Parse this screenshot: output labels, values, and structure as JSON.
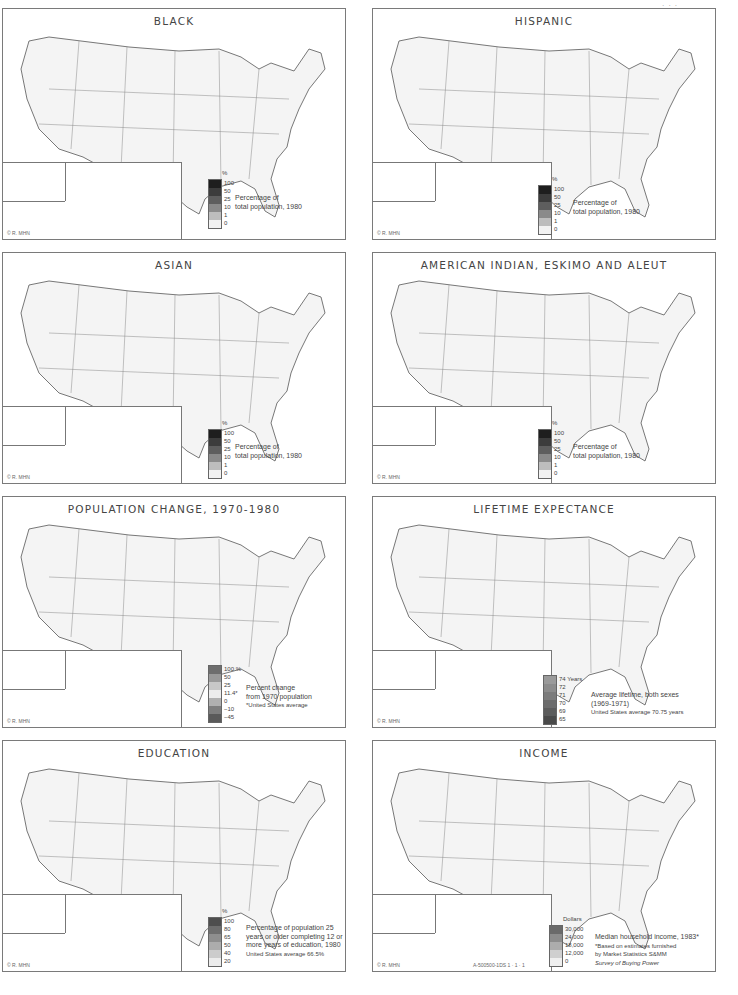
{
  "page": {
    "page_mark": "·  ·  ·",
    "plate_code": "A-500500-1DS  1 · 1 · 1"
  },
  "panels": [
    {
      "id": "black",
      "title": "BLACK",
      "legend": {
        "unit": "%",
        "ticks": [
          "100",
          "50",
          "25",
          "10",
          "1",
          "0"
        ],
        "colors": [
          "#1e1e1e",
          "#3c3c3c",
          "#5e5e5e",
          "#8a8a8a",
          "#bdbdbd",
          "#f2f2f2"
        ],
        "caption": [
          "Percentage of",
          "total population, 1980"
        ]
      },
      "credit": "© R. MHN"
    },
    {
      "id": "hispanic",
      "title": "HISPANIC",
      "legend": {
        "unit": "%",
        "ticks": [
          "100",
          "50",
          "25",
          "10",
          "1",
          "0"
        ],
        "colors": [
          "#1e1e1e",
          "#3c3c3c",
          "#5e5e5e",
          "#8a8a8a",
          "#bdbdbd",
          "#f2f2f2"
        ],
        "caption": [
          "Percentage of",
          "total population, 1980"
        ]
      },
      "credit": "© R. MHN"
    },
    {
      "id": "asian",
      "title": "ASIAN",
      "legend": {
        "unit": "%",
        "ticks": [
          "100",
          "50",
          "25",
          "10",
          "1",
          "0"
        ],
        "colors": [
          "#1e1e1e",
          "#3c3c3c",
          "#5e5e5e",
          "#8a8a8a",
          "#bdbdbd",
          "#f2f2f2"
        ],
        "caption": [
          "Percentage of",
          "total population, 1980"
        ]
      },
      "credit": "© R. MHN"
    },
    {
      "id": "american-indian",
      "title": "AMERICAN INDIAN, ESKIMO AND ALEUT",
      "legend": {
        "unit": "%",
        "ticks": [
          "100",
          "50",
          "25",
          "10",
          "1",
          "0"
        ],
        "colors": [
          "#1e1e1e",
          "#3c3c3c",
          "#5e5e5e",
          "#8a8a8a",
          "#bdbdbd",
          "#f2f2f2"
        ],
        "caption": [
          "Percentage of",
          "total population, 1980"
        ]
      },
      "credit": "© R. MHN"
    },
    {
      "id": "population-change",
      "title": "POPULATION CHANGE, 1970-1980",
      "legend": {
        "unit": "",
        "ticks": [
          "100 %",
          "50",
          "25",
          "11.4*",
          "0",
          "−10",
          "−45"
        ],
        "colors": [
          "#6e6e6e",
          "#9a9a9a",
          "#c8c8c8",
          "#ececec",
          "#b0b0b0",
          "#7e7e7e",
          "#5a5a5a"
        ],
        "caption": [
          "Percent change",
          "from 1970 population",
          "*United States average"
        ]
      },
      "credit": "© R. MHN"
    },
    {
      "id": "lifetime-expectancy",
      "title": "LIFETIME EXPECTANCE",
      "legend": {
        "unit": "",
        "ticks": [
          "74 Years",
          "72",
          "71",
          "70",
          "69",
          "65"
        ],
        "colors": [
          "#9a9a9a",
          "#8c8c8c",
          "#7c7c7c",
          "#6c6c6c",
          "#5c5c5c",
          "#4a4a4a"
        ],
        "caption": [
          "Average lifetime, both sexes",
          "(1969-1971)",
          "United States average 70.75 years"
        ]
      },
      "credit": "© R. MHN"
    },
    {
      "id": "education",
      "title": "EDUCATION",
      "legend": {
        "unit": "%",
        "ticks": [
          "100",
          "80",
          "65",
          "50",
          "40",
          "20"
        ],
        "colors": [
          "#4e4e4e",
          "#6e6e6e",
          "#8e8e8e",
          "#acacac",
          "#cccccc",
          "#ececec"
        ],
        "caption": [
          "Percentage of population 25",
          "years or older completing 12 or",
          "more years of education, 1980",
          "United States average 66.5%"
        ]
      },
      "credit": "© R. MHN"
    },
    {
      "id": "income",
      "title": "INCOME",
      "legend": {
        "unit": "Dollars",
        "ticks": [
          "30,000",
          "24,000",
          "18,000",
          "12,000",
          "0"
        ],
        "colors": [
          "#6a6a6a",
          "#8c8c8c",
          "#acacac",
          "#cfcfcf",
          "#efefef"
        ],
        "caption": [
          "Median household income, 1983*",
          "*Based on estimates furnished",
          "by Market Statistics S&MM",
          "Survey of Buying Power"
        ]
      },
      "credit": "© R. MHN"
    }
  ]
}
